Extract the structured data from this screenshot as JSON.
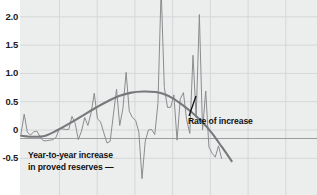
{
  "chart_title": "",
  "colors": {
    "plot_background": "#eceded",
    "page_background": "#ffffff",
    "gridline": "#d5d7d8",
    "series_line": "#8a8c8e",
    "trend_line": "#76797b",
    "reference_line": "#9a9c9e",
    "text": "#111111"
  },
  "axis": {
    "y_tick_labels": [
      "2.5",
      "2.0",
      "1.5",
      "1.0",
      "0.5",
      "0",
      "-0.5"
    ],
    "y_tick_values": [
      2.5,
      2.0,
      1.5,
      1.0,
      0.5,
      0,
      -0.5
    ]
  },
  "annotations": {
    "series_label_line1": "Year-to-year increase",
    "series_label_line2": "in proved reserves —",
    "curve_label": "Rate of increase"
  },
  "chart_data": {
    "type": "line",
    "title": "",
    "xlabel": "",
    "ylabel": "",
    "ylim": [
      -0.95,
      2.6
    ],
    "xlim": [
      0,
      100
    ],
    "grid": true,
    "legend_position": "inline-annotations",
    "y_ticks": [
      -0.5,
      0,
      0.5,
      1.0,
      1.5,
      2.0,
      2.5
    ],
    "x_gridlines": [
      13.3,
      26.0,
      38.7,
      51.4,
      64.1,
      76.8,
      89.5
    ],
    "reference_line_y": -0.15,
    "series": [
      {
        "name": "Year-to-year increase in proved reserves",
        "style": "jagged-thin",
        "x": [
          0.0,
          1.3,
          2.6,
          3.9,
          5.2,
          6.5,
          7.8,
          9.1,
          10.4,
          11.7,
          13.0,
          14.3,
          15.6,
          16.9,
          18.2,
          19.5,
          20.8,
          22.1,
          23.4,
          24.7,
          26.0,
          27.3,
          28.6,
          29.9,
          31.2,
          32.5,
          33.8,
          35.1,
          36.4,
          37.7,
          39.0,
          40.3,
          41.6,
          42.9,
          44.2,
          45.5,
          46.8,
          48.1,
          49.4,
          50.7,
          52.0,
          53.3,
          54.6,
          55.9,
          57.2,
          58.5,
          59.8,
          61.1,
          62.4,
          63.7,
          65.0,
          66.3,
          67.6,
          68.9,
          70.2,
          71.5,
          72.8,
          74.1,
          75.4,
          76.7,
          78.0,
          79.3,
          80.6,
          81.9
        ],
        "values": [
          -0.07,
          0.28,
          -0.04,
          -0.09,
          -0.03,
          -0.02,
          -0.12,
          -0.19,
          -0.19,
          -0.18,
          -0.17,
          -0.13,
          0.02,
          0.02,
          0.01,
          0.01,
          0.24,
          0.12,
          -0.17,
          -0.02,
          0.22,
          0.08,
          0.3,
          0.65,
          0.2,
          0.14,
          -0.05,
          -0.23,
          -0.2,
          0.27,
          0.72,
          0.08,
          0.38,
          1.02,
          0.33,
          0.22,
          0.17,
          -0.04,
          -0.86,
          -0.2,
          0.0,
          0.01,
          -0.08,
          0.47,
          2.5,
          0.75,
          0.4,
          0.4,
          0.62,
          -0.18,
          0.55,
          0.66,
          0.18,
          -0.06,
          1.32,
          0.22,
          2.04,
          0.0,
          0.69,
          -0.3,
          -0.41,
          -0.48,
          -0.28,
          -0.51
        ],
        "note": "Approximate readings of the thin jagged trace."
      },
      {
        "name": "Rate of increase",
        "style": "smooth-thick",
        "x": [
          0,
          5,
          10,
          15,
          20,
          25,
          30,
          35,
          40,
          45,
          50,
          55,
          58,
          62,
          66,
          70,
          74,
          78,
          82,
          86
        ],
        "values": [
          -0.1,
          -0.12,
          -0.1,
          0.0,
          0.12,
          0.25,
          0.38,
          0.5,
          0.6,
          0.66,
          0.68,
          0.67,
          0.64,
          0.56,
          0.44,
          0.3,
          0.14,
          -0.06,
          -0.3,
          -0.55
        ],
        "note": "Smooth trend curve rising to ~0.68 then declining."
      }
    ]
  }
}
